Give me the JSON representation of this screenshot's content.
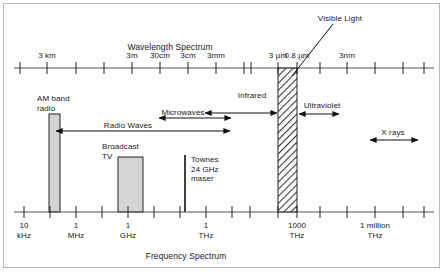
{
  "figure": {
    "top_axis_title": "Wavelength Spectrum",
    "bottom_axis_title": "Frequency Spectrum",
    "accent_color": "#000000",
    "bar_fill": "#d4d4d4",
    "axis_color": "#5a5a5a"
  },
  "wavelength_axis": {
    "title": "Wavelength Spectrum",
    "ticks": [
      {
        "label": "",
        "x": 20
      },
      {
        "label": "3 km",
        "x": 47
      },
      {
        "label": "",
        "x": 76
      },
      {
        "label": "",
        "x": 104
      },
      {
        "label": "3m",
        "x": 132
      },
      {
        "label": "30cm",
        "x": 160
      },
      {
        "label": "3cm",
        "x": 188
      },
      {
        "label": "3mm",
        "x": 216
      },
      {
        "label": "",
        "x": 244
      },
      {
        "label": "",
        "x": 251
      },
      {
        "label": "3 µm",
        "x": 278
      },
      {
        "label": "0.8 µm",
        "x": 297
      },
      {
        "label": "",
        "x": 320
      },
      {
        "label": "3nm",
        "x": 347
      },
      {
        "label": "",
        "x": 375
      },
      {
        "label": "",
        "x": 403
      },
      {
        "label": "",
        "x": 424
      }
    ]
  },
  "frequency_axis": {
    "title": "Frequency Spectrum",
    "ticks": [
      {
        "label": "10\nkHz",
        "x": 24
      },
      {
        "label": "",
        "x": 50
      },
      {
        "label": "1\nMHz",
        "x": 76
      },
      {
        "label": "",
        "x": 102
      },
      {
        "label": "1\nGHz",
        "x": 128
      },
      {
        "label": "",
        "x": 154
      },
      {
        "label": "",
        "x": 180
      },
      {
        "label": "1\nTHz",
        "x": 206
      },
      {
        "label": "",
        "x": 232
      },
      {
        "label": "",
        "x": 250
      },
      {
        "label": "",
        "x": 278
      },
      {
        "label": "1000\nTHz",
        "x": 297
      },
      {
        "label": "",
        "x": 320
      },
      {
        "label": "",
        "x": 347
      },
      {
        "label": "1 million\nTHz",
        "x": 375
      },
      {
        "label": "",
        "x": 403
      },
      {
        "label": "",
        "x": 424
      }
    ]
  },
  "bands": [
    {
      "name": "AM band radio",
      "label": "AM band\nradio",
      "label_x": 37,
      "label_y": 94,
      "x": 49,
      "width": 11,
      "top": 114,
      "bottom": 212,
      "style": "solid"
    },
    {
      "name": "Broadcast TV",
      "label": "Broadcast\nTV",
      "label_x": 102,
      "label_y": 142,
      "x": 118,
      "width": 25,
      "top": 157,
      "bottom": 212,
      "style": "solid"
    },
    {
      "name": "Townes 24 GHz maser",
      "label": "Townes\n24 GHz\nmaser",
      "label_x": 191,
      "label_y": 155,
      "x": 185,
      "width": 1.6,
      "top": 155,
      "bottom": 212,
      "style": "line"
    },
    {
      "name": "Visible light",
      "label": "",
      "label_x": 0,
      "label_y": 0,
      "x": 278,
      "width": 19,
      "top": 68,
      "bottom": 212,
      "style": "hatched"
    }
  ],
  "callouts": [
    {
      "name": "visible-light",
      "label": "Visible Light",
      "text_x": 340,
      "text_y": 14,
      "line_x1": 333,
      "line_y1": 24,
      "line_x2": 292,
      "line_y2": 76
    }
  ],
  "range_labels": [
    {
      "name": "radio-waves",
      "label": "Radio Waves",
      "text_x": 128,
      "text_y": 121,
      "arrow_y": 131,
      "arrow_x1": 56,
      "arrow_x2": 230,
      "heads": "both"
    },
    {
      "name": "microwaves",
      "label": "Microwaves",
      "text_x": 183,
      "text_y": 108,
      "arrow_y": 118,
      "arrow_x1": 159,
      "arrow_x2": 231,
      "heads": "both"
    },
    {
      "name": "infrared",
      "label": "Infrared",
      "text_x": 252,
      "text_y": 91,
      "arrow_y": 113,
      "arrow_x1": 205,
      "arrow_x2": 277,
      "heads": "both"
    },
    {
      "name": "ultraviolet",
      "label": "Ultraviolet",
      "text_x": 322,
      "text_y": 101,
      "arrow_y": 114,
      "arrow_x1": 299,
      "arrow_x2": 339,
      "heads": "both"
    },
    {
      "name": "x-rays",
      "label": "X rays",
      "text_x": 393,
      "text_y": 128,
      "arrow_y": 140,
      "arrow_x1": 370,
      "arrow_x2": 418,
      "heads": "both"
    }
  ],
  "axis_geometry": {
    "top_axis_y": 68,
    "top_axis_x1": 14,
    "top_axis_x2": 434,
    "bottom_axis_y": 212,
    "bottom_axis_x1": 14,
    "bottom_axis_x2": 434,
    "tick_up": 6,
    "tick_down": 6
  }
}
